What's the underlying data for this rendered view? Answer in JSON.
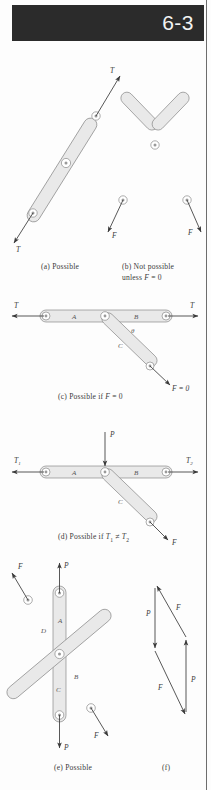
{
  "page": {
    "header_number": "6-3",
    "background": "#fdfdfd",
    "header_color": "#2b2b2b",
    "member_fill": "#e9e9e9",
    "member_stroke": "#7a7a7a",
    "ink": "#3a3a3a"
  },
  "figures": [
    {
      "id": "a",
      "caption": "(a) Possible",
      "description": "straight two-force member with collinear tension forces",
      "force_labels": [
        "T",
        "T"
      ],
      "member_labels": []
    },
    {
      "id": "b",
      "caption_line1": "(b) Not possible",
      "caption_line2": "unless F = 0",
      "description": "bent two-force member with non-collinear forces",
      "force_labels": [
        "F",
        "F"
      ],
      "member_labels": []
    },
    {
      "id": "c",
      "caption": "(c) Possible if F = 0",
      "description": "horizontal member AB with diagonal member C at angle theta",
      "force_labels": [
        "T",
        "T",
        "F = 0"
      ],
      "member_labels": [
        "A",
        "B",
        "C"
      ],
      "angle_label": "θ"
    },
    {
      "id": "d",
      "caption_html": "(d) Possible if T_1 ≠ T_2",
      "caption_prefix": "(d) Possible if ",
      "description": "horizontal member AB with applied load P at joint and diagonal member C",
      "force_labels": [
        "T",
        "T",
        "P",
        "F"
      ],
      "force_subscripts": [
        "1",
        "2"
      ],
      "member_labels": [
        "A",
        "B",
        "C"
      ]
    },
    {
      "id": "e",
      "caption": "(e) Possible",
      "description": "crossed members A D C B pinned at center with F and P force pairs",
      "force_labels": [
        "F",
        "P",
        "F",
        "P"
      ],
      "member_labels": [
        "A",
        "D",
        "C",
        "B"
      ]
    },
    {
      "id": "f",
      "caption": "(f)",
      "description": "closed force parallelogram of the two force pairs",
      "force_labels": [
        "P",
        "F",
        "F",
        "P"
      ],
      "member_labels": []
    }
  ],
  "captions": {
    "a": "(a) Possible",
    "b1": "(b) Not possible",
    "b2": "unless ",
    "b2_sym": "F",
    "b2_tail": " = 0",
    "c_pre": "(c) Possible if ",
    "c_sym": "F",
    "c_tail": " = 0",
    "d_pre": "(d) Possible if ",
    "d_t1": "T",
    "d_sub1": "1",
    "d_neq": " ≠ ",
    "d_t2": "T",
    "d_sub2": "2",
    "e": "(e) Possible",
    "f": "(f)"
  },
  "labels": {
    "T": "T",
    "F": "F",
    "P": "P",
    "A": "A",
    "B": "B",
    "C": "C",
    "D": "D",
    "theta": "θ",
    "F_eq_0": "F = 0",
    "sub1": "1",
    "sub2": "2"
  }
}
